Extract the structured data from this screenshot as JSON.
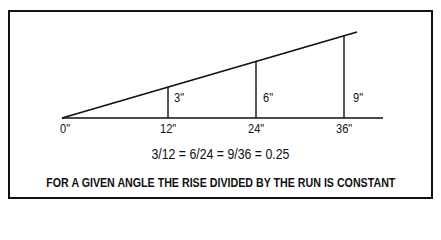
{
  "diagram": {
    "run_labels": [
      "0\"",
      "12\"",
      "24\"",
      "36\""
    ],
    "rise_labels": [
      "3\"",
      "6\"",
      "9\""
    ],
    "equation": "3/12 = 6/24 = 9/36 = 0.25",
    "caption": "FOR A GIVEN ANGLE THE RISE DIVIDED BY THE RUN IS CONSTANT",
    "colors": {
      "line": "#111111",
      "background": "#ffffff"
    }
  }
}
